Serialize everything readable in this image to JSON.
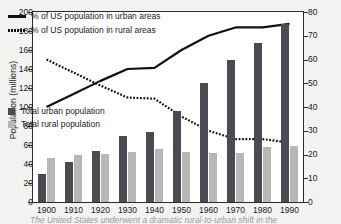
{
  "chart_data": {
    "type": "bar",
    "title": "",
    "caption": "The United States underwent a dramatic rural-to-urban shift in the",
    "categories": [
      "1900",
      "1910",
      "1920",
      "1930",
      "1940",
      "1950",
      "1960",
      "1970",
      "1980",
      "1990"
    ],
    "xlabel": "",
    "ylabel": "Population (millions)",
    "ylabel_right": "Percentage of population",
    "ylim": [
      0,
      200
    ],
    "ylim_right": [
      0,
      80
    ],
    "yticks": [
      0,
      20,
      40,
      60,
      80,
      100,
      120,
      140,
      160,
      180,
      200
    ],
    "yticks_right": [
      0,
      10,
      20,
      30,
      40,
      50,
      60,
      70,
      80
    ],
    "grid": false,
    "legend_position": "inside-upper-left and inside-mid-left",
    "series": [
      {
        "name": "Total urban population",
        "type": "bar",
        "axis": "left",
        "color": "#4b4b53",
        "values": [
          30,
          42,
          54,
          69,
          74,
          96,
          125,
          149,
          167,
          187
        ]
      },
      {
        "name": "Total rural population",
        "type": "bar",
        "axis": "left",
        "color": "#b7b7b7",
        "values": [
          46,
          50,
          51,
          53,
          56,
          53,
          52,
          52,
          58,
          59
        ]
      },
      {
        "name": "% of US population in urban areas",
        "type": "line",
        "style": "solid",
        "axis": "right",
        "color": "#111111",
        "values": [
          40,
          45.5,
          51,
          56,
          56.5,
          64,
          70,
          73.5,
          73.5,
          75
        ]
      },
      {
        "name": "% of US population in rural areas",
        "type": "line",
        "style": "dotted",
        "axis": "right",
        "color": "#111111",
        "values": [
          60,
          54.5,
          49,
          44,
          43.5,
          36,
          30,
          26.5,
          26.5,
          25
        ]
      }
    ]
  },
  "legend": {
    "urban_line": "% of US population in urban areas",
    "rural_line": "% of US population in rural areas",
    "urban_bar": "Total urban population",
    "rural_bar": "Total rural population"
  },
  "axes": {
    "left_title": "Population (millions)",
    "right_title": "Percentage of population"
  }
}
